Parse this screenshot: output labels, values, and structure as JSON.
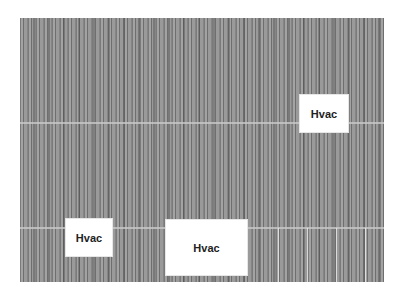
{
  "image": {
    "description": "Grayscale aerial view of corrugated metal roof panels with HVAC units masked by white labeled boxes",
    "labels": [
      {
        "text": "Hvac"
      },
      {
        "text": "Hvac"
      },
      {
        "text": "Hvac"
      }
    ],
    "colors": {
      "background": "#ffffff",
      "roof": "#8f8f8f",
      "label_box": "#ffffff",
      "label_text": "#222222"
    }
  }
}
